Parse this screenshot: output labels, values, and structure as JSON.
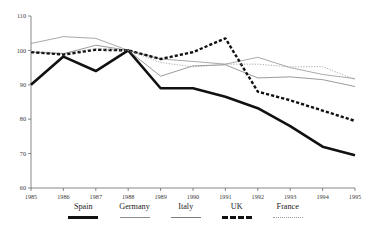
{
  "top_clipped_text": "",
  "chart_data": {
    "type": "line",
    "title": "",
    "xlabel": "",
    "ylabel": "",
    "x": [
      1985,
      1986,
      1987,
      1988,
      1989,
      1990,
      1991,
      1992,
      1993,
      1994,
      1995
    ],
    "categories": [
      "1985",
      "1986",
      "1987",
      "1988",
      "1989",
      "1990",
      "1991",
      "1992",
      "1993",
      "1994",
      "1995"
    ],
    "xlim": [
      1985,
      1995
    ],
    "ylim": [
      60,
      110
    ],
    "yticks": [
      60,
      70,
      80,
      90,
      100,
      110
    ],
    "ytick_labels": [
      "60",
      "70",
      "80",
      "90",
      "100",
      "110"
    ],
    "grid": false,
    "legend_position": "bottom",
    "series": [
      {
        "name": "Spain",
        "style": "thick-solid",
        "color": "#111111",
        "values": [
          90.0,
          98.2,
          94.0,
          100.0,
          89.0,
          89.0,
          86.5,
          83.2,
          78.0,
          72.0,
          69.5
        ]
      },
      {
        "name": "Germany",
        "style": "thin-solid",
        "color": "#8c8c8c",
        "values": [
          102.0,
          104.0,
          103.5,
          100.0,
          97.5,
          96.8,
          96.0,
          98.0,
          95.0,
          93.0,
          91.8
        ]
      },
      {
        "name": "Italy",
        "style": "thin-solid",
        "color": "#7a7a7a",
        "values": [
          99.5,
          99.0,
          101.5,
          100.0,
          92.5,
          95.5,
          95.8,
          92.0,
          92.3,
          91.5,
          89.5
        ]
      },
      {
        "name": "UK",
        "style": "thick-dashed",
        "color": "#111111",
        "values": [
          99.5,
          98.8,
          100.2,
          100.0,
          97.5,
          99.5,
          103.5,
          88.0,
          85.5,
          82.5,
          79.5
        ]
      },
      {
        "name": "France",
        "style": "dotted",
        "color": "#9a9a9a",
        "values": [
          99.8,
          99.2,
          100.5,
          100.0,
          96.5,
          95.2,
          96.0,
          96.0,
          95.2,
          95.3,
          91.5
        ]
      }
    ]
  },
  "legend": {
    "items": [
      {
        "label": "Spain"
      },
      {
        "label": "Germany"
      },
      {
        "label": "Italy"
      },
      {
        "label": "UK"
      },
      {
        "label": "France"
      }
    ]
  }
}
